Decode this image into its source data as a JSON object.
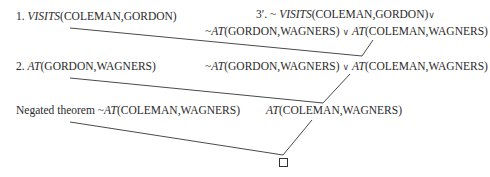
{
  "diagram": {
    "type": "resolution-refutation-tree",
    "nodes": {
      "clause1": {
        "label": "1.",
        "predicate": "VISITS",
        "args": "(COLEMAN,GORDON)"
      },
      "clause3prime": {
        "label": "3′.",
        "line1": {
          "neg": "~",
          "predicate": "VISITS",
          "args": "(COLEMAN,GORDON)",
          "or": "∨"
        },
        "line2": {
          "neg": "~",
          "predicate1": "AT",
          "args1": "(GORDON,WAGNERS)",
          "or": "∨",
          "predicate2": "AT",
          "args2": "(COLEMAN,WAGNERS)"
        }
      },
      "clause2": {
        "label": "2.",
        "predicate": "AT",
        "args": "(GORDON,WAGNERS)"
      },
      "resolvent1": {
        "neg": "~",
        "predicate1": "AT",
        "args1": "(GORDON,WAGNERS)",
        "or": "∨",
        "predicate2": "AT",
        "args2": "(COLEMAN,WAGNERS)"
      },
      "negated_theorem": {
        "label": "Negated theorem",
        "neg": "~",
        "predicate": "AT",
        "args": "(COLEMAN,WAGNERS)"
      },
      "resolvent2": {
        "predicate": "AT",
        "args": "(COLEMAN,WAGNERS)"
      },
      "empty_clause": {
        "symbol": "□"
      }
    },
    "edges": [
      {
        "from": "clause1",
        "to": "resolvent1"
      },
      {
        "from": "clause3prime",
        "to": "resolvent1"
      },
      {
        "from": "clause2",
        "to": "resolvent2"
      },
      {
        "from": "resolvent1",
        "to": "resolvent2"
      },
      {
        "from": "negated_theorem",
        "to": "empty_clause"
      },
      {
        "from": "resolvent2",
        "to": "empty_clause"
      }
    ]
  }
}
